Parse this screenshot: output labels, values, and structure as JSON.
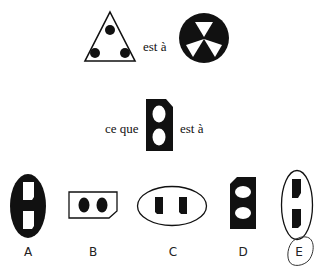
{
  "analogy": {
    "row1": {
      "connector": "est à",
      "left_figure": "triangle-with-three-dots-icon",
      "right_figure": "circle-with-three-white-triangles-icon"
    },
    "row2": {
      "prefix": "ce que",
      "connector": "est à",
      "figure": "black-plug-with-two-white-ovals-icon"
    }
  },
  "options": [
    {
      "label": "A",
      "figure": "black-oval-with-two-white-rectangles"
    },
    {
      "label": "B",
      "figure": "white-plug-with-two-black-ovals"
    },
    {
      "label": "C",
      "figure": "white-oval-with-two-black-rectangles-horizontal"
    },
    {
      "label": "D",
      "figure": "black-plug-with-two-white-ovals-vertical"
    },
    {
      "label": "E",
      "figure": "white-oval-with-two-black-rectangles-vertical",
      "circled": true
    }
  ],
  "colors": {
    "ink": "#111111",
    "background": "#ffffff"
  }
}
